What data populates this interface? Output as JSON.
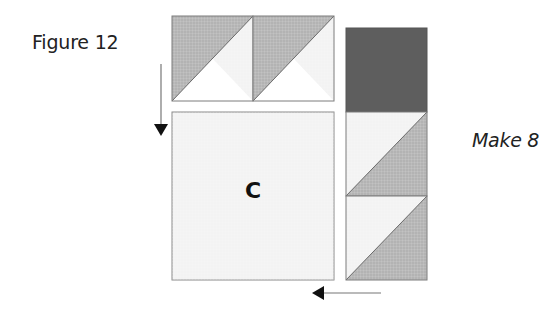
{
  "figure": {
    "title": "Figure 12",
    "instruction": "Make 8",
    "block_label": "C"
  },
  "colors": {
    "light_fabric": "#f3f3f3",
    "medium_fabric": "#b3b3b3",
    "dark_fabric": "#5e5e5e",
    "outline": "#7d7d7d",
    "arrow": "#111111"
  },
  "units": {
    "top_row": {
      "name": "half-square-triangle pair",
      "count": 2,
      "orientation": "dark triangle top-left, light triangle bottom-right"
    },
    "center_block": {
      "label": "C",
      "fill": "light"
    },
    "side_column": {
      "pieces": [
        "dark square",
        "half-square triangle (light top-left, medium bottom-right)",
        "half-square triangle (light top-left, medium bottom-right)"
      ]
    }
  },
  "arrows": [
    {
      "name": "down-arrow",
      "direction": "down",
      "meaning": "sew top pair to block C"
    },
    {
      "name": "left-arrow",
      "direction": "left",
      "meaning": "sew side column to block C"
    }
  ]
}
